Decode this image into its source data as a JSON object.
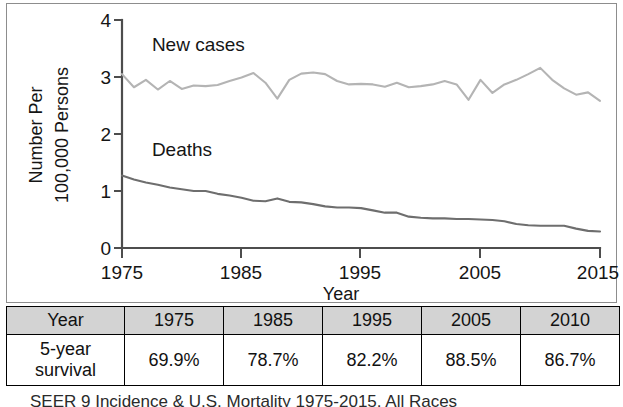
{
  "chart_data": {
    "type": "line",
    "title": "",
    "xlabel": "Year",
    "ylabel": "Number Per 100,000 Persons",
    "ylabel_line1": "Number Per",
    "ylabel_line2": "100,000 Persons",
    "xlim": [
      1975,
      2015
    ],
    "ylim": [
      0,
      4
    ],
    "xticks": [
      "1975",
      "1985",
      "1995",
      "2005",
      "2015"
    ],
    "xtick_values": [
      1975,
      1985,
      1995,
      2005,
      2015
    ],
    "yticks": [
      "0",
      "1",
      "2",
      "3",
      "4"
    ],
    "ytick_values": [
      0,
      1,
      2,
      3,
      4
    ],
    "grid": false,
    "legend_position": "inline-annotation",
    "series": [
      {
        "name": "New cases",
        "color": "#b4b4b4",
        "label_x": 1977.5,
        "label_y": 3.45,
        "x": [
          1975,
          1976,
          1977,
          1978,
          1979,
          1980,
          1981,
          1982,
          1983,
          1984,
          1985,
          1986,
          1987,
          1988,
          1989,
          1990,
          1991,
          1992,
          1993,
          1994,
          1995,
          1996,
          1997,
          1998,
          1999,
          2000,
          2001,
          2002,
          2003,
          2004,
          2005,
          2006,
          2007,
          2008,
          2009,
          2010,
          2011,
          2012,
          2013,
          2014,
          2015
        ],
        "values": [
          3.05,
          2.82,
          2.95,
          2.78,
          2.93,
          2.79,
          2.85,
          2.84,
          2.86,
          2.93,
          2.99,
          3.07,
          2.9,
          2.62,
          2.95,
          3.06,
          3.08,
          3.05,
          2.93,
          2.87,
          2.88,
          2.87,
          2.83,
          2.9,
          2.82,
          2.84,
          2.87,
          2.93,
          2.87,
          2.6,
          2.95,
          2.72,
          2.87,
          2.95,
          3.05,
          3.16,
          2.95,
          2.8,
          2.69,
          2.73,
          2.58
        ]
      },
      {
        "name": "Deaths",
        "color": "#6e6e6e",
        "label_x": 1977.5,
        "label_y": 1.62,
        "x": [
          1975,
          1976,
          1977,
          1978,
          1979,
          1980,
          1981,
          1982,
          1983,
          1984,
          1985,
          1986,
          1987,
          1988,
          1989,
          1990,
          1991,
          1992,
          1993,
          1994,
          1995,
          1996,
          1997,
          1998,
          1999,
          2000,
          2001,
          2002,
          2003,
          2004,
          2005,
          2006,
          2007,
          2008,
          2009,
          2010,
          2011,
          2012,
          2013,
          2014,
          2015
        ],
        "values": [
          1.27,
          1.2,
          1.15,
          1.11,
          1.06,
          1.03,
          1.0,
          1.0,
          0.95,
          0.92,
          0.88,
          0.83,
          0.82,
          0.87,
          0.81,
          0.8,
          0.77,
          0.73,
          0.71,
          0.71,
          0.7,
          0.66,
          0.62,
          0.62,
          0.55,
          0.53,
          0.52,
          0.52,
          0.51,
          0.51,
          0.5,
          0.49,
          0.47,
          0.42,
          0.4,
          0.39,
          0.39,
          0.39,
          0.34,
          0.3,
          0.29
        ]
      }
    ]
  },
  "table": {
    "header": [
      "Year",
      "1975",
      "1985",
      "1995",
      "2005",
      "2010"
    ],
    "rows": [
      {
        "label": "5-year",
        "label_line2": "survival",
        "values": [
          "69.9%",
          "78.7%",
          "82.2%",
          "88.5%",
          "86.7%"
        ]
      }
    ]
  },
  "caption": {
    "text": "SEER 9 Incidence & U.S. Mortality 1975-2015, All Races"
  },
  "colors": {
    "new_cases_line": "#b4b4b4",
    "deaths_line": "#6e6e6e",
    "axis": "#4d4d4d",
    "table_header_bg": "#d3d3d3",
    "frame": "#8d8d8d"
  }
}
